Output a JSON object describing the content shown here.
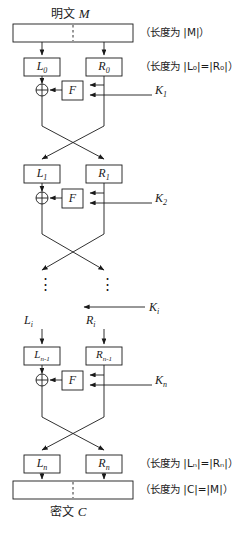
{
  "diagram": {
    "type": "feistel-cipher-structure",
    "top_caption": "明文 ",
    "top_caption_var": "M",
    "bottom_caption": "密文 ",
    "bottom_caption_var": "C",
    "plaintext_block_label": "",
    "ciphertext_block_label": ""
  },
  "annotations": {
    "len_m": "（长度为 |M|）",
    "len_l0r0_prefix": "（长度为 |",
    "len_l0r0": "（长度为 |L₀|=|R₀|）",
    "len_lnrn": "（长度为 |Lₙ|=|Rₙ|）",
    "len_c": "（长度为 |C|=|M|）"
  },
  "nodes": {
    "l0": "L",
    "l0_sub": "0",
    "r0": "R",
    "r0_sub": "0",
    "l1": "L",
    "l1_sub": "1",
    "r1": "R",
    "r1_sub": "1",
    "li": "L",
    "li_sub": "i",
    "ri": "R",
    "ri_sub": "i",
    "lnm1": "L",
    "lnm1_sub": "n-1",
    "rnm1": "R",
    "rnm1_sub": "n-1",
    "ln": "L",
    "ln_sub": "n",
    "rn": "R",
    "rn_sub": "n",
    "f": "F",
    "xor": "⊕",
    "vdots": "⋮"
  },
  "keys": {
    "k1": "K",
    "k1_sub": "1",
    "k2": "K",
    "k2_sub": "2",
    "ki": "K",
    "ki_sub": "i",
    "kn": "K",
    "kn_sub": "n"
  },
  "colors": {
    "stroke": "#1a1a1a",
    "background": "#ffffff",
    "text": "#1a1a1a"
  }
}
